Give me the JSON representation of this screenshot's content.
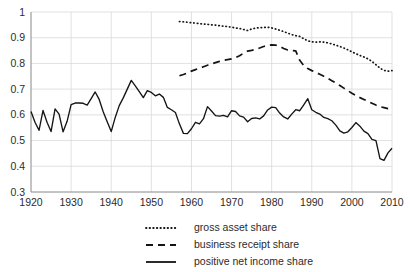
{
  "chart_data": {
    "type": "line",
    "title": "",
    "subtitle": "",
    "xlabel": "",
    "ylabel": "",
    "xlim": [
      1920,
      2010
    ],
    "ylim": [
      0.3,
      1.0
    ],
    "grid": true,
    "legend_position": "bottom",
    "y_ticks": [
      "0.3",
      "0.4",
      "0.5",
      "0.6",
      "0.7",
      "0.8",
      "0.9",
      "1"
    ],
    "y_tick_values": [
      0.3,
      0.4,
      0.5,
      0.6,
      0.7,
      0.8,
      0.9,
      1.0
    ],
    "x_ticks": [
      "1920",
      "1930",
      "1940",
      "1950",
      "1960",
      "1970",
      "1980",
      "1990",
      "2000",
      "2010"
    ],
    "x_tick_values": [
      1920,
      1930,
      1940,
      1950,
      1960,
      1970,
      1980,
      1990,
      2000,
      2010
    ],
    "series": [
      {
        "name": "gross asset share",
        "style": "dotted",
        "color": "#141414",
        "x": [
          1957,
          1958,
          1959,
          1960,
          1961,
          1962,
          1963,
          1964,
          1965,
          1966,
          1967,
          1968,
          1969,
          1970,
          1971,
          1972,
          1973,
          1974,
          1975,
          1976,
          1977,
          1978,
          1979,
          1980,
          1981,
          1982,
          1983,
          1984,
          1985,
          1986,
          1987,
          1988,
          1989,
          1990,
          1991,
          1992,
          1993,
          1994,
          1995,
          1996,
          1997,
          1998,
          1999,
          2000,
          2001,
          2002,
          2003,
          2004,
          2005,
          2006,
          2007,
          2008,
          2009,
          2010
        ],
        "values": [
          0.963,
          0.962,
          0.96,
          0.958,
          0.957,
          0.955,
          0.953,
          0.952,
          0.95,
          0.949,
          0.947,
          0.945,
          0.943,
          0.941,
          0.938,
          0.936,
          0.932,
          0.928,
          0.934,
          0.937,
          0.939,
          0.94,
          0.941,
          0.938,
          0.934,
          0.929,
          0.924,
          0.918,
          0.912,
          0.908,
          0.905,
          0.896,
          0.888,
          0.884,
          0.883,
          0.884,
          0.883,
          0.88,
          0.876,
          0.871,
          0.866,
          0.86,
          0.853,
          0.845,
          0.838,
          0.831,
          0.825,
          0.818,
          0.808,
          0.795,
          0.782,
          0.773,
          0.77,
          0.772
        ]
      },
      {
        "name": "business receipt share",
        "style": "dashed",
        "color": "#141414",
        "x": [
          1957,
          1958,
          1959,
          1960,
          1961,
          1962,
          1963,
          1964,
          1965,
          1966,
          1967,
          1968,
          1969,
          1970,
          1971,
          1972,
          1973,
          1974,
          1975,
          1976,
          1977,
          1978,
          1979,
          1980,
          1981,
          1982,
          1983,
          1984,
          1985,
          1986,
          1987,
          1988,
          1989,
          1990,
          1991,
          1992,
          1993,
          1994,
          1995,
          1996,
          1997,
          1998,
          1999,
          2000,
          2001,
          2002,
          2003,
          2004,
          2005,
          2006,
          2007,
          2008,
          2009,
          2010
        ],
        "values": [
          0.752,
          0.757,
          0.763,
          0.77,
          0.776,
          0.781,
          0.787,
          0.793,
          0.798,
          0.803,
          0.808,
          0.812,
          0.815,
          0.818,
          0.822,
          0.83,
          0.84,
          0.848,
          0.851,
          0.855,
          0.86,
          0.866,
          0.87,
          0.872,
          0.871,
          0.866,
          0.858,
          0.852,
          0.85,
          0.849,
          0.812,
          0.792,
          0.78,
          0.772,
          0.765,
          0.758,
          0.75,
          0.742,
          0.733,
          0.724,
          0.714,
          0.704,
          0.694,
          0.684,
          0.675,
          0.667,
          0.66,
          0.652,
          0.645,
          0.638,
          0.632,
          0.628,
          0.624,
          0.625
        ]
      },
      {
        "name": "positive net income share",
        "style": "solid",
        "color": "#141414",
        "x": [
          1920,
          1921,
          1922,
          1923,
          1924,
          1925,
          1926,
          1927,
          1928,
          1929,
          1930,
          1931,
          1932,
          1933,
          1934,
          1935,
          1936,
          1937,
          1938,
          1939,
          1940,
          1941,
          1942,
          1943,
          1944,
          1945,
          1946,
          1947,
          1948,
          1949,
          1950,
          1951,
          1952,
          1953,
          1954,
          1955,
          1956,
          1957,
          1958,
          1959,
          1960,
          1961,
          1962,
          1963,
          1964,
          1965,
          1966,
          1967,
          1968,
          1969,
          1970,
          1971,
          1972,
          1973,
          1974,
          1975,
          1976,
          1977,
          1978,
          1979,
          1980,
          1981,
          1982,
          1983,
          1984,
          1985,
          1986,
          1987,
          1988,
          1989,
          1990,
          1991,
          1992,
          1993,
          1994,
          1995,
          1996,
          1997,
          1998,
          1999,
          2000,
          2001,
          2002,
          2003,
          2004,
          2005,
          2006,
          2007,
          2008,
          2009,
          2010
        ],
        "values": [
          0.613,
          0.571,
          0.54,
          0.617,
          0.571,
          0.535,
          0.623,
          0.603,
          0.534,
          0.575,
          0.64,
          0.646,
          0.646,
          0.645,
          0.638,
          0.663,
          0.689,
          0.66,
          0.612,
          0.573,
          0.535,
          0.59,
          0.636,
          0.666,
          0.7,
          0.734,
          0.713,
          0.69,
          0.667,
          0.694,
          0.687,
          0.674,
          0.681,
          0.668,
          0.629,
          0.62,
          0.609,
          0.565,
          0.528,
          0.527,
          0.546,
          0.571,
          0.565,
          0.585,
          0.632,
          0.615,
          0.597,
          0.595,
          0.598,
          0.592,
          0.616,
          0.613,
          0.596,
          0.591,
          0.573,
          0.586,
          0.588,
          0.584,
          0.596,
          0.619,
          0.63,
          0.628,
          0.607,
          0.592,
          0.584,
          0.603,
          0.62,
          0.616,
          0.639,
          0.663,
          0.673,
          0.672,
          0.686,
          0.696,
          0.704,
          0.71,
          0.701,
          0.68,
          0.649,
          0.631,
          0.62,
          0.61,
          0.603,
          0.59,
          0.585,
          0.577,
          0.56,
          0.538,
          0.529,
          0.534,
          0.551
        ],
        "values_tail_note": ""
      }
    ],
    "series_solid_tail": {
      "x": [
        1990,
        1991,
        1992,
        1993,
        1994,
        1995,
        1996,
        1997,
        1998,
        1999,
        2000,
        2001,
        2002,
        2003,
        2004,
        2005,
        2006,
        2007,
        2008,
        2009,
        2010
      ],
      "values": [
        0.62,
        0.61,
        0.603,
        0.59,
        0.585,
        0.577,
        0.56,
        0.538,
        0.529,
        0.534,
        0.551,
        0.57,
        0.556,
        0.537,
        0.527,
        0.505,
        0.5,
        0.43,
        0.423,
        0.452,
        0.47
      ]
    }
  },
  "legend": {
    "items": [
      {
        "label": "gross asset share",
        "style": "dotted"
      },
      {
        "label": "business receipt share",
        "style": "dashed"
      },
      {
        "label": "positive net income share",
        "style": "solid"
      }
    ]
  }
}
